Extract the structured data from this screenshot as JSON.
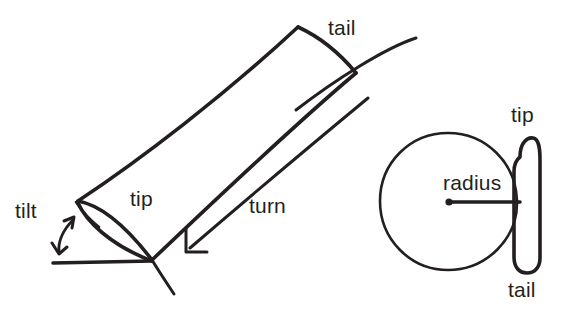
{
  "figure": {
    "background_color": "#ffffff",
    "ink_color": "#231f20",
    "style": "hand-drawn line art",
    "width": 562,
    "height": 329
  },
  "labels": {
    "tail_top": "tail",
    "tip_left": "tip",
    "tilt": "tilt",
    "turn": "turn",
    "radius": "radius",
    "tip_right": "tip",
    "tail_bottom": "tail"
  },
  "left_view": {
    "name": "perspective view",
    "annotations": [
      "tail",
      "tip",
      "tilt",
      "turn"
    ]
  },
  "right_view": {
    "name": "top-down view",
    "annotations": [
      "radius",
      "tip",
      "tail"
    ],
    "circle": {
      "cx": 448,
      "cy": 201,
      "r": 68
    },
    "radius_line": {
      "x1": 448,
      "y1": 202,
      "x2": 519,
      "y2": 202
    }
  }
}
